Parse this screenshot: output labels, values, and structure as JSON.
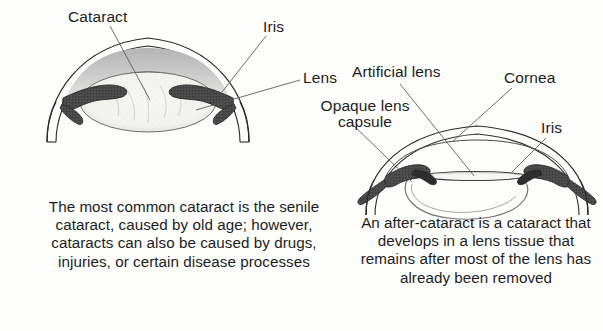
{
  "figure": {
    "background_color": "#fdfdfb",
    "ink_color": "#1d1d1d",
    "iris_color": "#4a4a4a",
    "cataract_shade_color": "#c9c9c9",
    "lens_fill_color": "#f2f2ef"
  },
  "left_diagram": {
    "name": "senile-cataract-eye",
    "labels": {
      "cataract": "Cataract",
      "iris": "Iris",
      "lens": "Lens"
    },
    "caption": "The most common cataract is the senile cataract, caused by old age; however, cataracts can also be caused by drugs, injuries, or certain disease processes"
  },
  "right_diagram": {
    "name": "after-cataract-eye",
    "labels": {
      "artificial_lens": "Artificial lens",
      "opaque_lens_capsule_line1": "Opaque lens",
      "opaque_lens_capsule_line2": "capsule",
      "cornea": "Cornea",
      "iris": "Iris"
    },
    "caption": "An after-cataract is a cataract that develops in a lens tissue that remains after most of the lens has already been removed"
  }
}
